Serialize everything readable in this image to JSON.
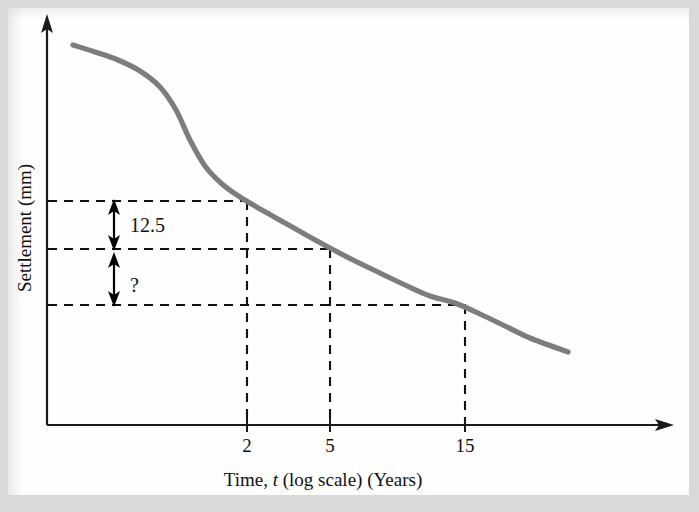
{
  "figure": {
    "background_color": "#d9d9d9",
    "plate_color": "#fefefe"
  },
  "chart_data": {
    "type": "line",
    "title": "",
    "subtitle": "",
    "xlabel_parts": {
      "before_italic": "Time, ",
      "italic": "t",
      "after_italic": " (log scale) (Years)"
    },
    "xlabel": "Time, t (log scale) (Years)",
    "ylabel": "Settlement (mm)",
    "x_scale": "log",
    "grid": false,
    "legend": null,
    "axis_style": {
      "x_axis_arrow": true,
      "y_axis_arrow": true,
      "curve_color": "#7d7d7d"
    },
    "xticks": [
      {
        "label": "2",
        "px": 247
      },
      {
        "label": "5",
        "px": 330
      },
      {
        "label": "15",
        "px": 465
      }
    ],
    "yticks": [],
    "series": [
      {
        "name": "settlement-curve",
        "color": "#7d7d7d",
        "points_px": [
          [
            73,
            45
          ],
          [
            95,
            52
          ],
          [
            118,
            60
          ],
          [
            140,
            71
          ],
          [
            160,
            87
          ],
          [
            176,
            110
          ],
          [
            190,
            140
          ],
          [
            205,
            166
          ],
          [
            222,
            184
          ],
          [
            240,
            197
          ],
          [
            262,
            210
          ],
          [
            285,
            223
          ],
          [
            308,
            236
          ],
          [
            330,
            248
          ],
          [
            355,
            261
          ],
          [
            380,
            273
          ],
          [
            405,
            285
          ],
          [
            430,
            296
          ],
          [
            455,
            303
          ],
          [
            480,
            314
          ],
          [
            505,
            326
          ],
          [
            530,
            338
          ],
          [
            568,
            352
          ]
        ]
      }
    ],
    "guide_lines": {
      "horizontal_px_y": [
        201,
        249,
        305
      ],
      "vertical_px_x": [
        247,
        330,
        465
      ],
      "style": "dashed"
    },
    "annotations": [
      {
        "id": "dim-125",
        "label": "12.5",
        "type": "double-headed-dimension-arrow",
        "from_px": [
          114,
          201
        ],
        "to_px": [
          114,
          249
        ],
        "label_px": [
          130,
          232
        ],
        "meaning": "settlement increment between t=2 and t=5"
      },
      {
        "id": "dim-unknown",
        "label": "?",
        "type": "double-headed-dimension-arrow",
        "from_px": [
          114,
          249
        ],
        "to_px": [
          114,
          305
        ],
        "label_px": [
          130,
          290
        ],
        "meaning": "unknown settlement increment between t=5 and t=15"
      }
    ],
    "axes_px": {
      "origin": [
        47,
        425
      ],
      "x_axis_end": [
        672,
        425
      ],
      "y_axis_top": [
        47,
        16
      ]
    }
  }
}
